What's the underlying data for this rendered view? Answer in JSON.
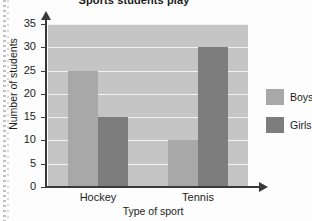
{
  "chart_data": {
    "type": "bar",
    "title": "Sports students play",
    "xlabel": "Type of sport",
    "ylabel": "Number of students",
    "categories": [
      "Hockey",
      "Tennis"
    ],
    "series": [
      {
        "name": "Boys",
        "values": [
          25,
          10
        ],
        "color": "#a8a8a8"
      },
      {
        "name": "Girls",
        "values": [
          15,
          30
        ],
        "color": "#7d7d7d"
      }
    ],
    "ylim": [
      0,
      35
    ],
    "ytick_step": 5,
    "yticks": [
      0,
      5,
      10,
      15,
      20,
      25,
      30,
      35
    ],
    "grid": true,
    "legend_position": "right",
    "plot_background": "#c5c5c5",
    "gridline_color": "#f2f2f2",
    "axis_color": "#3a3a3a"
  }
}
